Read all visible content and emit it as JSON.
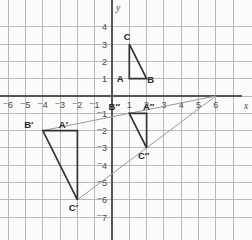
{
  "chart_data": {
    "type": "scatter",
    "title": "",
    "xlabel": "x",
    "ylabel": "y",
    "xlim": [
      -6.6,
      7.0
    ],
    "ylim": [
      -7.6,
      4.7
    ],
    "grid": true,
    "legend": "none",
    "x_ticks": [
      "-6",
      "-5",
      "-4",
      "-3",
      "-2",
      "-1",
      "1",
      "2",
      "3",
      "4",
      "5",
      "6"
    ],
    "x_tick_values": [
      -6,
      -5,
      -4,
      -3,
      -2,
      -1,
      1,
      2,
      3,
      4,
      5,
      6
    ],
    "y_ticks": [
      "4",
      "3",
      "2",
      "1",
      "-1",
      "-2",
      "-3",
      "-4",
      "-5",
      "-6",
      "-7"
    ],
    "y_tick_values": [
      4,
      3,
      2,
      1,
      -1,
      -2,
      -3,
      -4,
      -5,
      -6,
      -7
    ],
    "grid_spacing_units": 1,
    "center_of_dilation": {
      "label": "",
      "x": 6,
      "y": 0
    },
    "series": [
      {
        "name": "Triangle ABC",
        "type": "polygon",
        "closed": true,
        "color": "#333333",
        "points": [
          {
            "label": "A",
            "x": 1,
            "y": 1,
            "label_dx": -9,
            "label_dy": 3
          },
          {
            "label": "B",
            "x": 2,
            "y": 1,
            "label_dx": 4,
            "label_dy": 4
          },
          {
            "label": "C",
            "x": 1,
            "y": 3,
            "label_dx": -2,
            "label_dy": -4
          }
        ]
      },
      {
        "name": "Triangle A'B'C'",
        "type": "polygon",
        "closed": true,
        "color": "#333333",
        "points": [
          {
            "label": "A′",
            "x": -2,
            "y": -2,
            "label_dx": -14,
            "label_dy": -3
          },
          {
            "label": "B′",
            "x": -4,
            "y": -2,
            "label_dx": -14,
            "label_dy": -3
          },
          {
            "label": "C′",
            "x": -2,
            "y": -6,
            "label_dx": -4,
            "label_dy": 11
          }
        ]
      },
      {
        "name": "Triangle A″B″C″",
        "type": "polygon",
        "closed": true,
        "color": "#333333",
        "points": [
          {
            "label": "A″",
            "x": 2,
            "y": -1,
            "label_dx": 2,
            "label_dy": -3
          },
          {
            "label": "B″",
            "x": 1,
            "y": -1,
            "label_dx": -15,
            "label_dy": -3
          },
          {
            "label": "C″",
            "x": 2,
            "y": -3,
            "label_dx": -3,
            "label_dy": 11
          }
        ]
      },
      {
        "name": "Dilation ray through B″ and B′",
        "type": "line",
        "color": "#9a9a9a",
        "points": [
          {
            "x": 6,
            "y": 0
          },
          {
            "x": -4,
            "y": -2
          }
        ]
      },
      {
        "name": "Dilation ray through C″ and C′",
        "type": "line",
        "color": "#9a9a9a",
        "points": [
          {
            "x": 6,
            "y": 0
          },
          {
            "x": -2,
            "y": -6
          }
        ]
      }
    ],
    "colors": {
      "grid": "#b9b9bd",
      "axis": "#555558",
      "shape_stroke": "#333333",
      "ray_stroke": "#9a9a9a",
      "background": "#fbfbfa",
      "tick_label": "#4a4a4a"
    }
  }
}
